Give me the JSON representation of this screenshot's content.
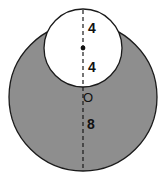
{
  "diagram": {
    "colors": {
      "shade": "#8e8e8e",
      "outline": "#1a1a1a",
      "inner_fill": "#ffffff"
    },
    "labels": {
      "top_segment": "4",
      "middle_segment": "4",
      "bottom_segment": "8",
      "center_point": "O"
    },
    "large_circle": {
      "radius_label": "8"
    },
    "small_circle": {
      "radius_label": "4"
    }
  }
}
